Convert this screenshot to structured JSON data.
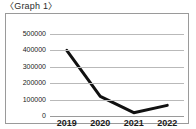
{
  "title": "〈Graph 1〉",
  "chart_data": {
    "type": "line",
    "title": "〈Graph 1〉",
    "xlabel": "",
    "ylabel": "",
    "categories": [
      "2019",
      "2020",
      "2021",
      "2022"
    ],
    "x": [
      2019,
      2020,
      2021,
      2022
    ],
    "values": [
      400000,
      120000,
      20000,
      65000
    ],
    "series": [
      {
        "name": "series-1",
        "values": [
          400000,
          120000,
          20000,
          65000
        ],
        "color": "#111111",
        "line_width": 3
      }
    ],
    "ylim": [
      0,
      500000
    ],
    "ytick_labels": [
      "500000",
      "400000",
      "300000",
      "200000",
      "100000",
      "0"
    ],
    "ytick_values": [
      500000,
      400000,
      300000,
      200000,
      100000,
      0
    ],
    "xtick_labels": [
      "2019",
      "2020",
      "2021",
      "2022"
    ],
    "grid": true,
    "grid_axis": "y",
    "grid_color": "#b9b9b9",
    "legend": false,
    "legend_position": "none",
    "frame_color": "#9a9a9a",
    "background": "#ffffff",
    "markers": false
  }
}
